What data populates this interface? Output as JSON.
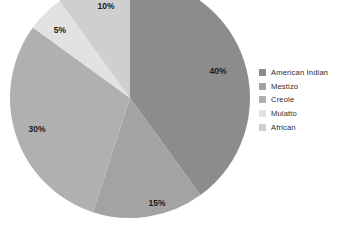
{
  "chart_data": {
    "type": "pie",
    "title": "",
    "categories": [
      "American Indian",
      "Mestizo",
      "Creole",
      "Mulatto",
      "African"
    ],
    "values": [
      40,
      15,
      30,
      5,
      10
    ],
    "value_labels": [
      "40%",
      "15%",
      "30%",
      "5%",
      "10%"
    ],
    "unit": "percent",
    "colors": [
      "#8c8c8c",
      "#a3a3a3",
      "#b0b0b0",
      "#e2e2e2",
      "#cfcfcf"
    ],
    "legend_position": "right",
    "start_angle_deg": 0,
    "direction": "clockwise",
    "grid": false,
    "background": "#ffffff",
    "label_color": "#1a1a1a",
    "note": "pie cropped at top edge of image",
    "geometry": {
      "center_x": 130,
      "center_y": 98,
      "radius": 120
    },
    "slices": [
      {
        "label": "American Indian",
        "value": 40,
        "value_label": "40%",
        "color": "#8c8c8c",
        "label_x": 218,
        "label_y": 72
      },
      {
        "label": "Mestizo",
        "value": 15,
        "value_label": "15%",
        "color": "#a3a3a3",
        "label_x": 157,
        "label_y": 204
      },
      {
        "label": "Creole",
        "value": 30,
        "value_label": "30%",
        "color": "#b0b0b0",
        "label_x": 37,
        "label_y": 130
      },
      {
        "label": "Mulatto",
        "value": 5,
        "value_label": "5%",
        "color": "#e2e2e2",
        "label_x": 60,
        "label_y": 31
      },
      {
        "label": "African",
        "value": 10,
        "value_label": "10%",
        "color": "#cfcfcf",
        "label_x": 106,
        "label_y": 7
      }
    ]
  },
  "legend": {
    "items": [
      {
        "label": "American Indian",
        "color": "#8c8c8c"
      },
      {
        "label": "Mestizo",
        "color": "#a3a3a3"
      },
      {
        "label": "Creole",
        "color": "#b0b0b0"
      },
      {
        "label": "Mulatto",
        "color": "#e2e2e2"
      },
      {
        "label": "African",
        "color": "#cfcfcf"
      }
    ]
  }
}
